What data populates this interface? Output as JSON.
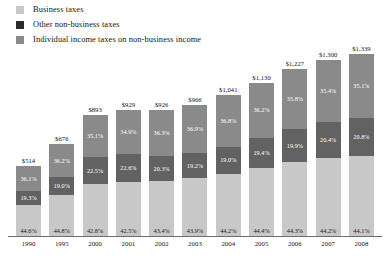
{
  "legend": {
    "items": [
      {
        "label": "Business taxes",
        "color": "#c8c8c8",
        "swatch_name": "legend-swatch-business"
      },
      {
        "label": "Other non-business taxes",
        "color": "#2b2b2b",
        "swatch_name": "legend-swatch-other-nonbusiness"
      },
      {
        "label": "Individual income taxes on non-business income",
        "color": "#8a8a8a",
        "swatch_name": "legend-swatch-individual-income"
      }
    ]
  },
  "colors": {
    "business": "#c8c8c8",
    "other_nonbusiness": "#626262",
    "individual_income": "#8a8a8a",
    "axis": "#6d6d6d",
    "text": "#141414"
  },
  "chart_data": {
    "type": "bar",
    "title": "",
    "subtitle": "",
    "xlabel": "",
    "ylabel": "",
    "stacked": true,
    "stack_mode": "absolute-total-with-percent-labels",
    "grid": false,
    "legend_position": "top-left",
    "categories": [
      "1990",
      "1995",
      "2000",
      "2001",
      "2002",
      "2003",
      "2004",
      "2005",
      "2006",
      "2007",
      "2008"
    ],
    "totals": [
      514,
      676,
      893,
      929,
      926,
      966,
      1041,
      1130,
      1227,
      1300,
      1339
    ],
    "total_labels": [
      "$514",
      "$676",
      "$893",
      "$929",
      "$926",
      "$966",
      "$1,041",
      "$1,130",
      "$1,227",
      "$1,300",
      "$1,339"
    ],
    "ylim": [
      0,
      1400
    ],
    "series": [
      {
        "name": "Individual income taxes on non-business income",
        "color": "#8a8a8a",
        "position": "top",
        "values": [
          36.1,
          36.2,
          35.1,
          34.9,
          36.3,
          36.9,
          36.8,
          36.2,
          35.8,
          35.4,
          35.1
        ],
        "labels": [
          "36.1%",
          "36.2%",
          "35.1%",
          "34.9%",
          "36.3%",
          "36.9%",
          "36.8%",
          "36.2%",
          "35.8%",
          "35.4%",
          "35.1%"
        ]
      },
      {
        "name": "Other non-business taxes",
        "color": "#626262",
        "position": "middle",
        "values": [
          19.3,
          19.0,
          22.5,
          22.6,
          20.3,
          19.2,
          19.0,
          19.4,
          19.9,
          20.4,
          20.8
        ],
        "labels": [
          "19.3%",
          "19.0%",
          "22.5%",
          "22.6%",
          "20.3%",
          "19.2%",
          "19.0%",
          "19.4%",
          "19.9%",
          "20.4%",
          "20.8%"
        ]
      },
      {
        "name": "Business taxes",
        "color": "#c8c8c8",
        "position": "bottom",
        "values": [
          44.6,
          44.8,
          42.8,
          42.5,
          43.4,
          43.9,
          44.2,
          44.4,
          44.3,
          44.2,
          44.1
        ],
        "labels": [
          "44.6%",
          "44.8%",
          "42.8%",
          "42.5%",
          "43.4%",
          "43.9%",
          "44.2%",
          "44.4%",
          "44.3%",
          "44.2%",
          "44.1%"
        ]
      }
    ]
  }
}
